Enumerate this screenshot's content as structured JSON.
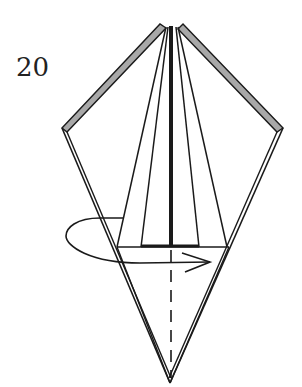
{
  "diagram": {
    "step_number": "20",
    "colors": {
      "line": "#1a1a1a",
      "paper_edge_fill": "#a8a8a8",
      "background": "#ffffff"
    },
    "symbols": [
      "turn-over-arrow",
      "valley-fold-line"
    ]
  }
}
